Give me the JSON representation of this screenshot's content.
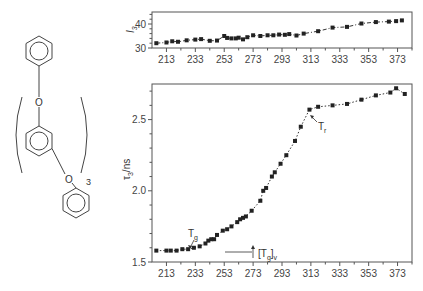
{
  "molecule": {
    "atom_labels": [
      "O",
      "O"
    ],
    "repeat_subscript": "3"
  },
  "chart_data": [
    {
      "type": "scatter",
      "panel": "top",
      "title": "",
      "xlabel": "",
      "ylabel": "I3",
      "ylabel_main": "I",
      "ylabel_sub": "3",
      "xlim": [
        203,
        383
      ],
      "ylim": [
        30,
        45
      ],
      "x_ticks": [
        213,
        233,
        253,
        273,
        293,
        313,
        333,
        353,
        373
      ],
      "y_ticks": [
        30,
        40
      ],
      "grid": false,
      "x": [
        206,
        213,
        217,
        221,
        227,
        233,
        237,
        243,
        248,
        253,
        255,
        258,
        261,
        263,
        266,
        269,
        273,
        278,
        283,
        287,
        291,
        295,
        298,
        303,
        308,
        318,
        328,
        338,
        348,
        358,
        367,
        372,
        376
      ],
      "values": [
        32.0,
        32.3,
        32.8,
        32.6,
        33.2,
        33.5,
        33.7,
        33.0,
        33.1,
        35.0,
        34.2,
        34.0,
        34.0,
        34.3,
        33.6,
        34.5,
        35.3,
        35.0,
        35.3,
        35.3,
        35.6,
        35.5,
        35.8,
        35.2,
        36.0,
        37.0,
        38.5,
        38.8,
        40.2,
        40.8,
        41.0,
        41.2,
        41.5
      ],
      "fit_line": "dash-dot"
    },
    {
      "type": "scatter",
      "panel": "bottom",
      "title": "",
      "xlabel": "",
      "ylabel": "τ3/ns",
      "ylabel_main": "τ",
      "ylabel_sub": "3",
      "ylabel_unit": "/ns",
      "xlim": [
        203,
        383
      ],
      "ylim": [
        1.5,
        2.75
      ],
      "x_ticks": [
        213,
        233,
        253,
        273,
        293,
        313,
        333,
        353,
        373
      ],
      "y_ticks": [
        1.5,
        2.0,
        2.5
      ],
      "grid": false,
      "x": [
        206,
        213,
        216,
        220,
        224,
        228,
        232,
        236,
        240,
        242,
        244,
        246,
        248,
        252,
        255,
        258,
        262,
        264,
        266,
        268,
        272,
        278,
        280,
        282,
        286,
        288,
        292,
        296,
        302,
        306,
        312,
        318,
        328,
        338,
        348,
        358,
        368,
        372,
        378
      ],
      "values": [
        1.58,
        1.58,
        1.58,
        1.58,
        1.59,
        1.59,
        1.6,
        1.61,
        1.63,
        1.65,
        1.66,
        1.66,
        1.69,
        1.72,
        1.73,
        1.75,
        1.78,
        1.8,
        1.81,
        1.82,
        1.86,
        1.93,
        2.0,
        2.02,
        2.1,
        2.13,
        2.19,
        2.25,
        2.35,
        2.45,
        2.57,
        2.59,
        2.6,
        2.61,
        2.64,
        2.67,
        2.69,
        2.72,
        2.68
      ],
      "fit_line": "dotted",
      "annotations": [
        {
          "label": "T_g",
          "text_main": "T",
          "text_sub": "g",
          "x": 233,
          "y": 1.6
        },
        {
          "label": "[T_g]_v",
          "text_main": "[T",
          "text_sub": "g",
          "text_end": "]",
          "text_sub2": "v",
          "x": 252,
          "y": 1.6
        },
        {
          "label": "T_r",
          "text_main": "T",
          "text_sub": "r",
          "x": 312,
          "y": 2.57
        }
      ]
    }
  ]
}
